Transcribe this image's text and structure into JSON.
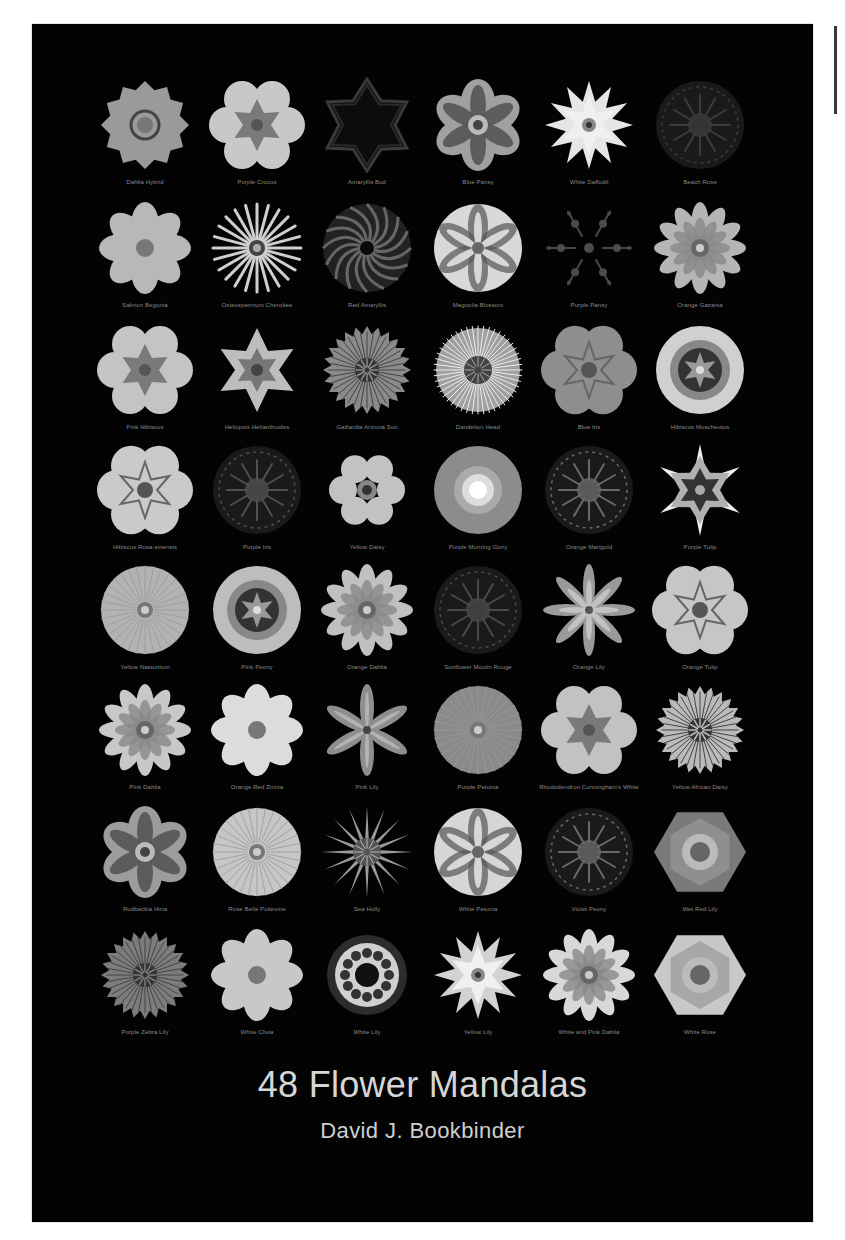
{
  "cover": {
    "title": "48 Flower Mandalas",
    "author": "David J. Bookbinder",
    "background_color": "#030303",
    "text_color": "#d6d6d6"
  },
  "grid": {
    "columns": 6,
    "rows": 8,
    "mandalas": [
      {
        "caption": "Dahlia Hybrid",
        "style": "star12",
        "tone": "#9a9a9a"
      },
      {
        "caption": "Purple Crocus",
        "style": "hex-lobed",
        "tone": "#c8c8c8"
      },
      {
        "caption": "Amaryllis Bud",
        "style": "dark-star",
        "tone": "#3a3a3a"
      },
      {
        "caption": "Blue Pansy",
        "style": "petal6",
        "tone": "#a0a0a0"
      },
      {
        "caption": "White Daffodil",
        "style": "star6-bright",
        "tone": "#e6e6e6"
      },
      {
        "caption": "Beach Rose",
        "style": "dark-radial",
        "tone": "#3c3c3c"
      },
      {
        "caption": "Salmon Begonia",
        "style": "petal8",
        "tone": "#b8b8b8"
      },
      {
        "caption": "Osteospermum Cherokee",
        "style": "spokes",
        "tone": "#cfcfcf"
      },
      {
        "caption": "Red Amaryllis",
        "style": "swirl",
        "tone": "#6e6e6e"
      },
      {
        "caption": "Magnolia Blossom",
        "style": "petal6-large",
        "tone": "#d8d8d8"
      },
      {
        "caption": "Purple Pansy",
        "style": "dark-sparse",
        "tone": "#4a4a4a"
      },
      {
        "caption": "Orange Gazania",
        "style": "petal12",
        "tone": "#b5b5b5"
      },
      {
        "caption": "Pink Hibiscus",
        "style": "hex-lobed",
        "tone": "#c4c4c4"
      },
      {
        "caption": "Heliopsis Helianthoides",
        "style": "star6-small",
        "tone": "#bdbdbd"
      },
      {
        "caption": "Gaillardia Arizona Sun",
        "style": "spokes-dense",
        "tone": "#8a8a8a"
      },
      {
        "caption": "Dandelion Head",
        "style": "fuzzy",
        "tone": "#bcbcbc"
      },
      {
        "caption": "Blue Iris",
        "style": "lobed-round",
        "tone": "#8e8e8e"
      },
      {
        "caption": "Hibiscus Moscheutos",
        "style": "round-rings",
        "tone": "#d0d0d0"
      },
      {
        "caption": "Hibiscus Rosa-sinensis",
        "style": "lobed-round",
        "tone": "#cacaca"
      },
      {
        "caption": "Purple Iris",
        "style": "dark-radial",
        "tone": "#505050"
      },
      {
        "caption": "Yellow Daisy",
        "style": "petal6-small",
        "tone": "#c2c2c2"
      },
      {
        "caption": "Purple Morning Glory",
        "style": "glow",
        "tone": "#8c8c8c"
      },
      {
        "caption": "Orange Marigold",
        "style": "dark-radial",
        "tone": "#6a6a6a"
      },
      {
        "caption": "Purple Tulip",
        "style": "star6-spikes",
        "tone": "#b0b0b0"
      },
      {
        "caption": "Yellow Nasturtium",
        "style": "round-fine",
        "tone": "#b3b3b3"
      },
      {
        "caption": "Pink Peony",
        "style": "round-rings",
        "tone": "#bdbdbd"
      },
      {
        "caption": "Orange Dahlia",
        "style": "petal12",
        "tone": "#c0c0c0"
      },
      {
        "caption": "Sunflower Moulin Rouge",
        "style": "dark-radial",
        "tone": "#4a4a4a"
      },
      {
        "caption": "Orange Lily",
        "style": "star8-thin",
        "tone": "#9a9a9a"
      },
      {
        "caption": "Orange Tulip",
        "style": "lobed-round",
        "tone": "#c6c6c6"
      },
      {
        "caption": "Pink Dahlia",
        "style": "petal12",
        "tone": "#c8c8c8"
      },
      {
        "caption": "Orange Red Zinnia",
        "style": "petal8",
        "tone": "#dcdcdc"
      },
      {
        "caption": "Pink Lily",
        "style": "star6-thin",
        "tone": "#8e8e8e"
      },
      {
        "caption": "Purple Petunia",
        "style": "round-fine",
        "tone": "#8a8a8a"
      },
      {
        "caption": "Rhododendron Cunningham's White",
        "style": "hex-lobed",
        "tone": "#c2c2c2"
      },
      {
        "caption": "Yellow African Daisy",
        "style": "spokes-dense",
        "tone": "#bababa"
      },
      {
        "caption": "Rudbeckia Hirta",
        "style": "petal6",
        "tone": "#9c9c9c"
      },
      {
        "caption": "Rose Belle Poitevine",
        "style": "round-fine",
        "tone": "#c6c6c6"
      },
      {
        "caption": "Sea Holly",
        "style": "star-spiky",
        "tone": "#9a9a9a"
      },
      {
        "caption": "White Petunia",
        "style": "petal6-large",
        "tone": "#d6d6d6"
      },
      {
        "caption": "Violet Peony",
        "style": "dark-radial",
        "tone": "#6a6a6a"
      },
      {
        "caption": "Wet Red Lily",
        "style": "hexagon",
        "tone": "#7a7a7a"
      },
      {
        "caption": "Purple Zebra Lily",
        "style": "spokes-dense",
        "tone": "#7c7c7c"
      },
      {
        "caption": "White Clivia",
        "style": "petal8",
        "tone": "#c8c8c8"
      },
      {
        "caption": "White Lily",
        "style": "glow-ring",
        "tone": "#d0d0d0"
      },
      {
        "caption": "Yellow Lily",
        "style": "star6-bright",
        "tone": "#d2d2d2"
      },
      {
        "caption": "White and Pink Dahlia",
        "style": "petal12",
        "tone": "#d8d8d8"
      },
      {
        "caption": "White Rose",
        "style": "hexagon",
        "tone": "#c8c8c8"
      }
    ]
  }
}
